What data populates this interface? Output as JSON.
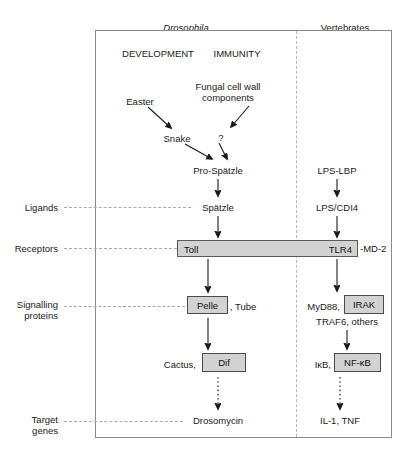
{
  "figure": {
    "type": "pathway-diagram",
    "title_columns": {
      "left": "Drosophila",
      "right": "Vertebrates"
    },
    "subheaders": {
      "development": "DEVELOPMENT",
      "immunity": "IMMUNITY"
    },
    "row_labels": {
      "ligands": "Ligands",
      "receptors": "Receptors",
      "signalling_line1": "Signalling",
      "signalling_line2": "proteins",
      "target_line1": "Target",
      "target_line2": "genes"
    },
    "drosophila_pathway": {
      "easter": "Easter",
      "snake": "Snake",
      "fungal_line1": "Fungal cell wall",
      "fungal_line2": "components",
      "unknown": "?",
      "pro_spatzle": "Pro-Spätzle",
      "spatzle": "Spätzle",
      "toll": "Toll",
      "pelle": "Pelle",
      "tube": ", Tube",
      "cactus": "Cactus,",
      "dif": "Dif",
      "drosomycin": "Drosomycin"
    },
    "vertebrate_pathway": {
      "lps_lbp": "LPS-LBP",
      "lps_cd14": "LPS/CDI4",
      "tlr4": "TLR4",
      "md2": "-MD-2",
      "myd88": "MyD88,",
      "irak": "IRAK",
      "traf6": "TRAF6, others",
      "ikb": "IκB,",
      "nfkb": "NF-κB",
      "il1_tnf": "IL-1, TNF"
    },
    "colors": {
      "box_fill": "#d2d2d2",
      "box_stroke": "#4a4a4a",
      "frame_stroke": "#8a8a8a",
      "guide_dash": "#aaaaaa",
      "divider_dash": "#b4b4b4",
      "text": "#1a1a1a"
    }
  }
}
